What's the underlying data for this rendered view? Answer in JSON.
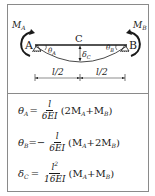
{
  "diagram": {
    "labels": {
      "moment_a": "M",
      "moment_a_sub": "A",
      "moment_b": "M",
      "moment_b_sub": "B",
      "support_a": "A",
      "support_b": "B",
      "midpoint": "C",
      "theta_a": "θ",
      "theta_a_sub": "A",
      "theta_b": "θ",
      "theta_b_sub": "B",
      "delta_c": "δ",
      "delta_c_sub": "C",
      "dim_left": "l/2",
      "dim_right": "l/2"
    },
    "colors": {
      "stroke": "#1a1a1a",
      "frame": "#8a8a8a"
    }
  },
  "formulas": [
    {
      "lhs_symbol": "θ",
      "lhs_sub": "A",
      "eq": "=",
      "sign": "",
      "numerator": "l",
      "numerator_sup": "",
      "denominator": "6EI",
      "rhs": "(2M",
      "rhs_sub1": "A",
      "rhs_mid": "+M",
      "rhs_sub2": "B",
      "rhs_end": ")"
    },
    {
      "lhs_symbol": "θ",
      "lhs_sub": "B",
      "eq": "=",
      "sign": "−",
      "numerator": "l",
      "numerator_sup": "",
      "denominator": "6EI",
      "rhs": "(M",
      "rhs_sub1": "A",
      "rhs_mid": "+2M",
      "rhs_sub2": "B",
      "rhs_end": ")"
    },
    {
      "lhs_symbol": "δ",
      "lhs_sub": "C",
      "eq": "=",
      "sign": "",
      "numerator": "l",
      "numerator_sup": "2",
      "denominator": "16EI",
      "rhs": "(M",
      "rhs_sub1": "A",
      "rhs_mid": "+M",
      "rhs_sub2": "B",
      "rhs_end": ")"
    }
  ]
}
